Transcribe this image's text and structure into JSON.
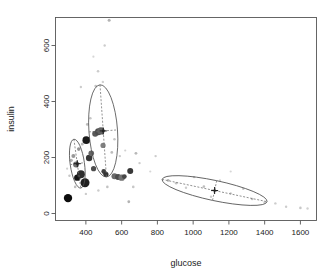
{
  "chart_data": {
    "type": "scatter",
    "title": "",
    "xlabel": "glucose",
    "ylabel": "insulin",
    "xlim": [
      230,
      1690
    ],
    "ylim": [
      -25,
      700
    ],
    "grid": false,
    "legend": "none",
    "xticks": [
      400,
      600,
      800,
      1000,
      1200,
      1400,
      1600
    ],
    "yticks": [
      0,
      200,
      400,
      600
    ],
    "xtick_labels": [
      "400",
      "600",
      "800",
      "1000",
      "1200",
      "1400",
      "1600"
    ],
    "ytick_labels": [
      "0",
      "200",
      "400",
      "600"
    ],
    "series": [
      {
        "name": "observations",
        "comment": "glucose (x), insulin (y), rendered radius px, gray level 0=black 1=white",
        "points": [
          {
            "x": 300,
            "y": 55,
            "r": 4.2,
            "gray": 0.05
          },
          {
            "x": 345,
            "y": 175,
            "r": 3.0,
            "gray": 0.45
          },
          {
            "x": 352,
            "y": 128,
            "r": 3.2,
            "gray": 0.08
          },
          {
            "x": 372,
            "y": 140,
            "r": 4.0,
            "gray": 0.18
          },
          {
            "x": 395,
            "y": 110,
            "r": 4.5,
            "gray": 0.12
          },
          {
            "x": 402,
            "y": 262,
            "r": 3.8,
            "gray": 0.1
          },
          {
            "x": 418,
            "y": 198,
            "r": 3.2,
            "gray": 0.22
          },
          {
            "x": 430,
            "y": 215,
            "r": 2.8,
            "gray": 0.4
          },
          {
            "x": 443,
            "y": 160,
            "r": 2.6,
            "gray": 0.3
          },
          {
            "x": 452,
            "y": 285,
            "r": 3.0,
            "gray": 0.35
          },
          {
            "x": 470,
            "y": 292,
            "r": 3.4,
            "gray": 0.3
          },
          {
            "x": 484,
            "y": 295,
            "r": 3.6,
            "gray": 0.38
          },
          {
            "x": 496,
            "y": 243,
            "r": 2.6,
            "gray": 0.5
          },
          {
            "x": 500,
            "y": 150,
            "r": 2.4,
            "gray": 0.25
          },
          {
            "x": 512,
            "y": 140,
            "r": 2.6,
            "gray": 0.2
          },
          {
            "x": 560,
            "y": 133,
            "r": 3.0,
            "gray": 0.42
          },
          {
            "x": 580,
            "y": 130,
            "r": 3.0,
            "gray": 0.3
          },
          {
            "x": 600,
            "y": 128,
            "r": 3.2,
            "gray": 0.45
          },
          {
            "x": 615,
            "y": 132,
            "r": 2.4,
            "gray": 0.28
          },
          {
            "x": 648,
            "y": 152,
            "r": 3.0,
            "gray": 0.22
          },
          {
            "x": 330,
            "y": 205,
            "r": 2.0,
            "gray": 0.6
          },
          {
            "x": 318,
            "y": 190,
            "r": 1.6,
            "gray": 0.7
          },
          {
            "x": 360,
            "y": 230,
            "r": 1.8,
            "gray": 0.58
          },
          {
            "x": 380,
            "y": 248,
            "r": 1.5,
            "gray": 0.72
          },
          {
            "x": 408,
            "y": 318,
            "r": 1.4,
            "gray": 0.74
          },
          {
            "x": 425,
            "y": 340,
            "r": 1.3,
            "gray": 0.78
          },
          {
            "x": 455,
            "y": 455,
            "r": 1.4,
            "gray": 0.76
          },
          {
            "x": 468,
            "y": 508,
            "r": 1.3,
            "gray": 0.8
          },
          {
            "x": 495,
            "y": 470,
            "r": 1.2,
            "gray": 0.82
          },
          {
            "x": 505,
            "y": 600,
            "r": 1.2,
            "gray": 0.8
          },
          {
            "x": 530,
            "y": 690,
            "r": 1.5,
            "gray": 0.7
          },
          {
            "x": 442,
            "y": 560,
            "r": 1.1,
            "gray": 0.84
          },
          {
            "x": 372,
            "y": 452,
            "r": 1.2,
            "gray": 0.8
          },
          {
            "x": 545,
            "y": 218,
            "r": 1.4,
            "gray": 0.74
          },
          {
            "x": 560,
            "y": 265,
            "r": 1.3,
            "gray": 0.78
          },
          {
            "x": 590,
            "y": 205,
            "r": 1.2,
            "gray": 0.8
          },
          {
            "x": 620,
            "y": 225,
            "r": 1.1,
            "gray": 0.82
          },
          {
            "x": 680,
            "y": 215,
            "r": 1.4,
            "gray": 0.72
          },
          {
            "x": 700,
            "y": 180,
            "r": 1.2,
            "gray": 0.8
          },
          {
            "x": 665,
            "y": 95,
            "r": 1.3,
            "gray": 0.78
          },
          {
            "x": 640,
            "y": 42,
            "r": 1.4,
            "gray": 0.7
          },
          {
            "x": 520,
            "y": 95,
            "r": 1.3,
            "gray": 0.76
          },
          {
            "x": 470,
            "y": 82,
            "r": 1.2,
            "gray": 0.8
          },
          {
            "x": 400,
            "y": 70,
            "r": 1.2,
            "gray": 0.8
          },
          {
            "x": 340,
            "y": 95,
            "r": 1.3,
            "gray": 0.74
          },
          {
            "x": 308,
            "y": 135,
            "r": 1.2,
            "gray": 0.78
          },
          {
            "x": 295,
            "y": 160,
            "r": 1.1,
            "gray": 0.82
          },
          {
            "x": 860,
            "y": 118,
            "r": 1.4,
            "gray": 0.72
          },
          {
            "x": 905,
            "y": 108,
            "r": 1.3,
            "gray": 0.76
          },
          {
            "x": 960,
            "y": 92,
            "r": 1.2,
            "gray": 0.8
          },
          {
            "x": 1005,
            "y": 130,
            "r": 1.2,
            "gray": 0.78
          },
          {
            "x": 1060,
            "y": 96,
            "r": 1.3,
            "gray": 0.74
          },
          {
            "x": 1100,
            "y": 60,
            "r": 1.2,
            "gray": 0.8
          },
          {
            "x": 1150,
            "y": 118,
            "r": 1.1,
            "gray": 0.82
          },
          {
            "x": 1210,
            "y": 72,
            "r": 1.2,
            "gray": 0.78
          },
          {
            "x": 1280,
            "y": 88,
            "r": 1.2,
            "gray": 0.78
          },
          {
            "x": 1330,
            "y": 52,
            "r": 1.3,
            "gray": 0.76
          },
          {
            "x": 1400,
            "y": 40,
            "r": 1.2,
            "gray": 0.8
          },
          {
            "x": 1460,
            "y": 36,
            "r": 1.2,
            "gray": 0.8
          },
          {
            "x": 1520,
            "y": 24,
            "r": 1.2,
            "gray": 0.8
          },
          {
            "x": 1600,
            "y": 20,
            "r": 1.3,
            "gray": 0.78
          },
          {
            "x": 1640,
            "y": 18,
            "r": 1.2,
            "gray": 0.82
          },
          {
            "x": 790,
            "y": 205,
            "r": 1.2,
            "gray": 0.8
          },
          {
            "x": 760,
            "y": 150,
            "r": 1.1,
            "gray": 0.84
          },
          {
            "x": 1210,
            "y": 150,
            "r": 1.1,
            "gray": 0.84
          }
        ]
      }
    ],
    "clusters": [
      {
        "name": "cluster-low",
        "center": {
          "x": 352,
          "y": 178
        },
        "rx": 40,
        "ry": 88,
        "angle_deg": -8
      },
      {
        "name": "cluster-mid",
        "center": {
          "x": 497,
          "y": 295
        },
        "rx": 80,
        "ry": 165,
        "angle_deg": -4
      },
      {
        "name": "cluster-high",
        "center": {
          "x": 1120,
          "y": 82
        },
        "rx": 300,
        "ry": 36,
        "angle_deg": 12
      }
    ]
  }
}
